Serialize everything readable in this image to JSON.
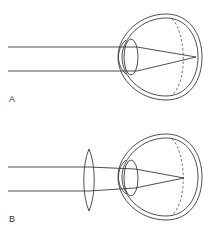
{
  "figure": {
    "panels": [
      {
        "label": "A",
        "has_corrective_lens": false,
        "focus": "behind retina"
      },
      {
        "label": "B",
        "has_corrective_lens": true,
        "corrective_lens_type": "convex",
        "focus": "on retina"
      }
    ]
  }
}
